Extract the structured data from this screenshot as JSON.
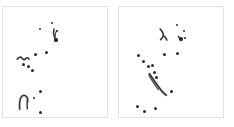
{
  "figure": {
    "title": "",
    "type": "two-panel point scatter with ink strokes",
    "background_color": "#ffffff",
    "panel_border_color": "#e2e2e2",
    "mark_color": "#2a2a2a",
    "stroke_color": "#3a3a3a",
    "width": 234,
    "height": 127
  },
  "chart_data": {
    "type": "scatter",
    "title": "",
    "subtitle": "",
    "xlabel": "",
    "ylabel": "",
    "grid": false,
    "legend": "none",
    "axis_ticks": "none",
    "panel_count": 2,
    "panels": [
      {
        "name": "left-panel",
        "label": "",
        "frame": {
          "x": 2,
          "y": 6,
          "w": 106,
          "h": 112
        },
        "xlim": [
          0,
          106
        ],
        "ylim": [
          0,
          112
        ],
        "point_count": 13,
        "points": [
          {
            "x": 37,
            "y": 22,
            "r": 1.3
          },
          {
            "x": 49,
            "y": 16,
            "r": 1.3
          },
          {
            "x": 54,
            "y": 24,
            "r": 1.2
          },
          {
            "x": 53,
            "y": 33,
            "r": 1.6
          },
          {
            "x": 32,
            "y": 47,
            "r": 1.5
          },
          {
            "x": 43,
            "y": 45,
            "r": 1.5
          },
          {
            "x": 20,
            "y": 57,
            "r": 1.5
          },
          {
            "x": 25,
            "y": 59,
            "r": 1.5
          },
          {
            "x": 29,
            "y": 63,
            "r": 1.5
          },
          {
            "x": 37,
            "y": 84,
            "r": 1.5
          },
          {
            "x": 31,
            "y": 91,
            "r": 1.3
          },
          {
            "x": 37,
            "y": 105,
            "r": 1.5
          },
          {
            "x": 30,
            "y": 111,
            "r": 1.4
          }
        ],
        "strokes": [
          {
            "name": "top-hook-stroke",
            "path": "M 52.0 22.5 C 51.2 25.0 51.6 28.0 52.4 30.5 C 52.9 32.2 53.6 33.2 54.3 33.8",
            "width": 1.6
          },
          {
            "name": "top-hook-tail",
            "path": "M 54.6 24.0 C 53.6 26.0 53.0 28.5 53.2 30.6",
            "width": 1.1
          },
          {
            "name": "mid-tilde-stroke",
            "path": "M 14.5 53.0 C 16.8 50.6 18.6 50.4 19.6 52.2 C 20.5 53.8 21.8 54.1 23.2 52.6 C 24.4 51.3 25.6 51.4 26.4 53.0",
            "width": 1.7
          },
          {
            "name": "bottom-arch-stroke",
            "path": "M 17.0 104.0 C 16.6 99.2 17.0 94.6 18.2 92.2 C 19.6 89.5 22.6 89.2 24.2 91.6 C 25.2 93.1 25.4 95.0 25.2 96.4",
            "width": 1.8
          },
          {
            "name": "bottom-arch-stem",
            "path": "M 24.8 95.0 C 24.6 98.6 24.6 101.4 24.8 103.6",
            "width": 1.5
          }
        ]
      },
      {
        "name": "right-panel",
        "label": "",
        "frame": {
          "x": 118,
          "y": 6,
          "w": 106,
          "h": 112
        },
        "xlim": [
          0,
          106
        ],
        "ylim": [
          0,
          112
        ],
        "point_count": 16,
        "points": [
          {
            "x": 58,
            "y": 18,
            "r": 1.4
          },
          {
            "x": 65,
            "y": 24,
            "r": 1.4
          },
          {
            "x": 62,
            "y": 32,
            "r": 1.8
          },
          {
            "x": 66,
            "y": 31,
            "r": 1.4
          },
          {
            "x": 19,
            "y": 48,
            "r": 1.5
          },
          {
            "x": 24,
            "y": 54,
            "r": 1.5
          },
          {
            "x": 29,
            "y": 59,
            "r": 1.5
          },
          {
            "x": 33,
            "y": 58,
            "r": 1.5
          },
          {
            "x": 35,
            "y": 65,
            "r": 1.5
          },
          {
            "x": 45,
            "y": 47,
            "r": 1.5
          },
          {
            "x": 58,
            "y": 46,
            "r": 1.5
          },
          {
            "x": 37,
            "y": 70,
            "r": 1.5
          },
          {
            "x": 52,
            "y": 84,
            "r": 1.5
          },
          {
            "x": 18,
            "y": 99,
            "r": 1.5
          },
          {
            "x": 25,
            "y": 104,
            "r": 1.5
          },
          {
            "x": 36,
            "y": 101,
            "r": 1.5
          }
        ],
        "strokes": [
          {
            "name": "top-zigzag-stroke",
            "path": "M 42.0 22.5 C 44.4 25.2 45.6 27.4 45.0 29.6 C 44.4 31.6 43.2 32.4 42.4 33.2 M 45.2 29.0 C 47.0 30.6 48.2 32.0 48.8 33.6",
            "width": 1.7
          },
          {
            "name": "top-right-tick-stroke",
            "path": "M 60.5 30.0 C 61.8 31.6 62.6 32.8 63.0 34.2",
            "width": 1.6
          },
          {
            "name": "long-diagonal-stroke",
            "path": "M 31.0 68.0 C 34.4 73.0 38.6 79.0 42.6 84.4 C 44.6 87.0 46.4 88.6 48.2 89.8",
            "width": 1.9
          },
          {
            "name": "diagonal-shadow-stroke",
            "path": "M 30.4 69.5 C 33.2 74.2 36.6 79.4 40.0 84.2",
            "width": 1.2
          }
        ]
      }
    ]
  }
}
